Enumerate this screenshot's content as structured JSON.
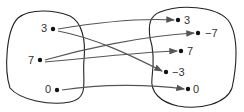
{
  "diagram": {
    "type": "mapping",
    "domain": [
      "3",
      "7",
      "0"
    ],
    "codomain": [
      "3",
      "−7",
      "7",
      "−3",
      "0"
    ],
    "arrows": [
      {
        "from": "3",
        "to": "3"
      },
      {
        "from": "3",
        "to": "−3"
      },
      {
        "from": "7",
        "to": "−7"
      },
      {
        "from": "7",
        "to": "7"
      },
      {
        "from": "0",
        "to": "0"
      }
    ],
    "colors": {
      "stroke": "#222222",
      "arrow": "#555555"
    }
  }
}
